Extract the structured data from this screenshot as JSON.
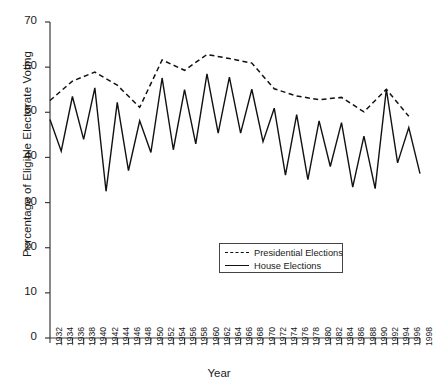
{
  "chart_data": {
    "type": "line",
    "title": "",
    "xlabel": "Year",
    "ylabel": "Percentage of Eligible Electorate Voting",
    "xlim": [
      1932,
      1998
    ],
    "ylim": [
      0,
      70
    ],
    "yticks": [
      0,
      10,
      20,
      30,
      40,
      50,
      60,
      70
    ],
    "grid": false,
    "legend_position": "inside-bottom-center",
    "categories": [
      1932,
      1934,
      1936,
      1938,
      1940,
      1942,
      1944,
      1946,
      1948,
      1950,
      1952,
      1954,
      1956,
      1958,
      1960,
      1962,
      1964,
      1966,
      1968,
      1970,
      1972,
      1974,
      1976,
      1978,
      1980,
      1982,
      1984,
      1986,
      1988,
      1990,
      1992,
      1994,
      1996,
      1998
    ],
    "series": [
      {
        "name": "Presidential Elections",
        "style": "dashed",
        "x": [
          1932,
          1936,
          1940,
          1944,
          1948,
          1952,
          1956,
          1960,
          1964,
          1968,
          1972,
          1976,
          1980,
          1984,
          1988,
          1992,
          1996
        ],
        "values": [
          52.6,
          56.9,
          58.9,
          56.0,
          51.1,
          61.6,
          59.3,
          62.8,
          61.9,
          60.9,
          55.2,
          53.6,
          52.8,
          53.3,
          50.1,
          55.1,
          49.1
        ]
      },
      {
        "name": "House Elections",
        "style": "solid",
        "x": [
          1932,
          1934,
          1936,
          1938,
          1940,
          1942,
          1944,
          1946,
          1948,
          1950,
          1952,
          1954,
          1956,
          1958,
          1960,
          1962,
          1964,
          1966,
          1968,
          1970,
          1972,
          1974,
          1976,
          1978,
          1980,
          1982,
          1984,
          1986,
          1988,
          1990,
          1992,
          1994,
          1996,
          1998
        ],
        "values": [
          48.4,
          41.4,
          53.5,
          44.0,
          55.4,
          32.5,
          52.2,
          37.1,
          48.1,
          41.1,
          57.6,
          41.7,
          55.0,
          43.0,
          58.5,
          45.4,
          57.8,
          45.4,
          55.1,
          43.5,
          50.9,
          36.1,
          49.5,
          35.1,
          48.1,
          38.0,
          47.7,
          33.4,
          44.7,
          33.1,
          55.1,
          38.8,
          46.6,
          36.4
        ]
      }
    ]
  },
  "legend": {
    "items": [
      {
        "label": "Presidential Elections",
        "style": "dashed"
      },
      {
        "label": "House Elections",
        "style": "solid"
      }
    ]
  },
  "colors": {
    "line": "#111111",
    "axis": "#3a3a3a",
    "background": "#ffffff"
  }
}
